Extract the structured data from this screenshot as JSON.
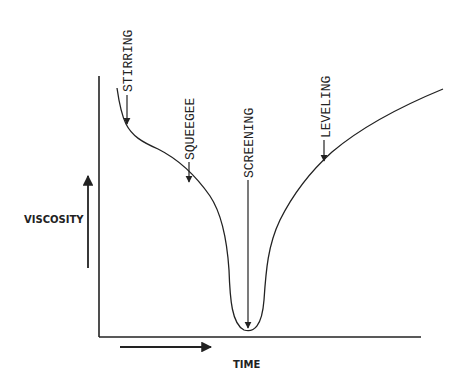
{
  "diagram": {
    "axes": {
      "y_label": "VISCOSITY",
      "x_label": "TIME"
    },
    "annotations": [
      {
        "id": "stirring",
        "label": "STIRRING"
      },
      {
        "id": "squeegee",
        "label": "SQUEEGEE"
      },
      {
        "id": "screening",
        "label": "SCREENING"
      },
      {
        "id": "leveling",
        "label": "LEVELING"
      }
    ],
    "colors": {
      "line": "#222222",
      "background": "#ffffff"
    }
  }
}
